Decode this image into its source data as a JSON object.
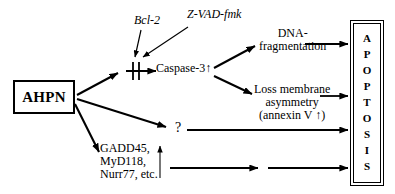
{
  "diagram": {
    "source_node": {
      "label": "AHPN"
    },
    "outcome_node": {
      "label": "APOPTOSIS",
      "letters": [
        "A",
        "P",
        "O",
        "P",
        "T",
        "O",
        "S",
        "I",
        "S"
      ]
    },
    "inhibitors": [
      {
        "id": "bcl2",
        "label": "Bcl-2"
      },
      {
        "id": "zvadfmk",
        "label": "Z-VAD-fmk"
      }
    ],
    "nodes": [
      {
        "id": "caspase3",
        "label": "Caspase-3",
        "marker": "↑"
      },
      {
        "id": "unknown",
        "label": "?"
      },
      {
        "id": "dna_fragmentation",
        "line1": "DNA-",
        "line2": "fragmentation"
      },
      {
        "id": "membrane_asymmetry",
        "line1": "Loss membrane",
        "line2": "asymmetry",
        "line3": "(annexin V",
        "line3_marker": "↑",
        "line3_close": ")"
      },
      {
        "id": "genes",
        "line1": "GADD45,",
        "line2": "MyD118,",
        "line3": "Nurr77, etc.",
        "marker": "↑"
      }
    ],
    "colors": {
      "stroke": "#000000",
      "background": "#ffffff"
    }
  }
}
